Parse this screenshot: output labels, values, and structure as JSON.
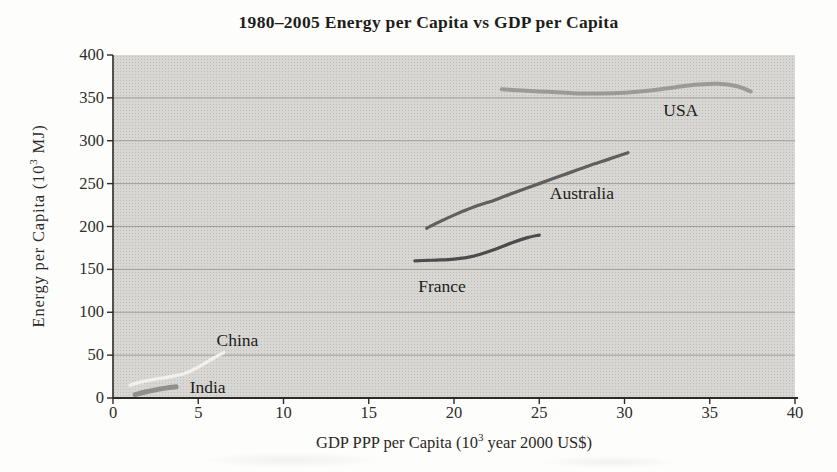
{
  "chart_data": {
    "type": "line",
    "title": "1980–2005 Energy per Capita vs GDP per Capita",
    "xlabel": "GDP PPP per Capita (10^3 year 2000 US$)",
    "ylabel": "Energy per Capita (10^3 MJ)",
    "xlabel_parts": {
      "pre": "GDP PPP per Capita (10",
      "sup": "3",
      "post": " year 2000 US$)"
    },
    "ylabel_parts": {
      "pre": "Energy per Capita (10",
      "sup": "3",
      "post": " MJ)"
    },
    "xlim": [
      0,
      40
    ],
    "ylim": [
      0,
      400
    ],
    "x_ticks": [
      0,
      5,
      10,
      15,
      20,
      25,
      30,
      35,
      40
    ],
    "y_ticks": [
      0,
      50,
      100,
      150,
      200,
      250,
      300,
      350,
      400
    ],
    "grid": "horizontal-only",
    "legend": "inline-labels",
    "colors": {
      "plot_bg": "#d8d7d4",
      "grid_line": "#9f9e9b",
      "axis_line": "#2b2a27",
      "label_text": "#1c1c19"
    },
    "series": [
      {
        "name": "India",
        "color": "#908f8b",
        "stroke_width": 5,
        "x": [
          1.3,
          1.9,
          2.5,
          3.1,
          3.7
        ],
        "y": [
          4,
          7,
          9.5,
          11.5,
          13
        ],
        "label": "India",
        "label_at": [
          5.55,
          10
        ]
      },
      {
        "name": "China",
        "color": "#f1f1ec",
        "stroke_width": 3.4,
        "x": [
          1.0,
          1.6,
          2.3,
          3.0,
          3.7,
          4.4,
          5.0,
          5.6,
          6.2,
          6.5
        ],
        "y": [
          15,
          18.5,
          21.5,
          23.5,
          26,
          30,
          36,
          43,
          50,
          53
        ],
        "label": "China",
        "label_at": [
          7.3,
          65
        ]
      },
      {
        "name": "France",
        "color": "#4c4c4e",
        "stroke_width": 3.2,
        "x": [
          17.7,
          18.4,
          19.2,
          20.0,
          20.8,
          21.6,
          22.5,
          23.4,
          24.3,
          25.0
        ],
        "y": [
          160,
          160.5,
          161,
          162,
          164,
          168,
          174,
          181,
          187,
          190
        ],
        "label": "France",
        "label_at": [
          19.3,
          128
        ]
      },
      {
        "name": "Australia",
        "color": "#605f5d",
        "stroke_width": 3.2,
        "x": [
          18.4,
          19.2,
          20.2,
          21.2,
          22.4,
          23.6,
          25.0,
          26.4,
          27.8,
          29.0,
          30.2
        ],
        "y": [
          198,
          206,
          215,
          223,
          231,
          240,
          250,
          260,
          270,
          278,
          286
        ],
        "label": "Australia",
        "label_at": [
          27.5,
          237
        ]
      },
      {
        "name": "USA",
        "color": "#9b9a96",
        "stroke_width": 4,
        "x": [
          22.8,
          24.0,
          25.5,
          27.0,
          28.5,
          30.0,
          31.5,
          33.0,
          34.3,
          35.5,
          36.6,
          37.4
        ],
        "y": [
          360,
          358.5,
          357,
          355.5,
          355,
          356,
          358.5,
          362.5,
          365.5,
          366.5,
          363.5,
          357.5
        ],
        "label": "USA",
        "label_at": [
          33.3,
          334
        ]
      }
    ]
  }
}
